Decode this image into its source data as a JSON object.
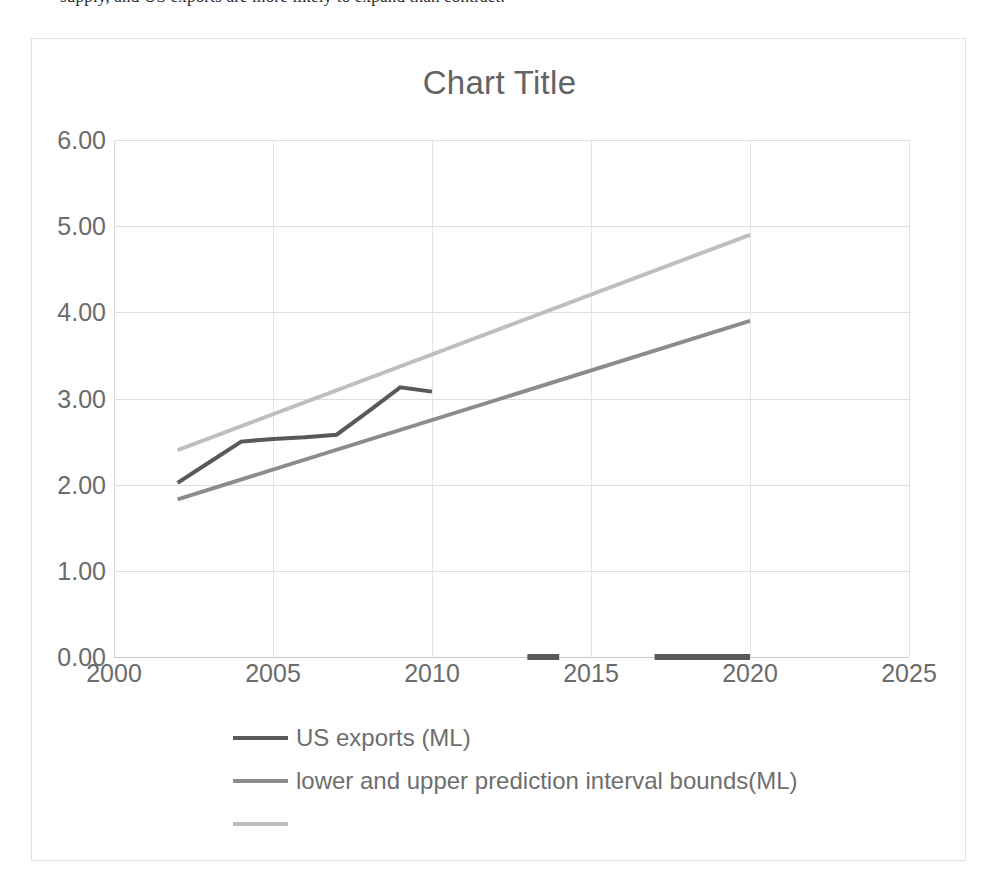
{
  "page": {
    "cropped_text_above": "supply, and US exports are more likely to expand than contract."
  },
  "chart_data": {
    "type": "line",
    "title": "Chart Title",
    "xlabel": "",
    "ylabel": "",
    "xlim": [
      2000,
      2025
    ],
    "ylim": [
      0.0,
      6.0
    ],
    "xticks": [
      "2000",
      "2005",
      "2010",
      "2015",
      "2020",
      "2025"
    ],
    "xtick_values": [
      2000,
      2005,
      2010,
      2015,
      2020,
      2025
    ],
    "yticks": [
      "0.00",
      "1.00",
      "2.00",
      "3.00",
      "4.00",
      "5.00",
      "6.00"
    ],
    "ytick_values": [
      0.0,
      1.0,
      2.0,
      3.0,
      4.0,
      5.0,
      6.0
    ],
    "grid": true,
    "legend_position": "bottom",
    "series": [
      {
        "name": "US exports (ML)",
        "color": "#595959",
        "x": [
          2002,
          2003,
          2004,
          2005,
          2006,
          2007,
          2008,
          2009,
          2010
        ],
        "values": [
          2.02,
          2.26,
          2.5,
          2.53,
          2.55,
          2.58,
          2.85,
          3.13,
          3.08
        ]
      },
      {
        "name": "lower and upper prediction interval bounds(ML)",
        "color": "#8c8c8c",
        "x": [
          2002,
          2020
        ],
        "values": [
          1.83,
          3.9
        ]
      },
      {
        "name": "",
        "color": "#bfbfbf",
        "x": [
          2002,
          2020
        ],
        "values": [
          2.4,
          4.9
        ]
      },
      {
        "name": "zero-axis markers",
        "color": "#595959",
        "segments": [
          {
            "x": [
              2013,
              2014
            ],
            "values": [
              0.0,
              0.0
            ]
          },
          {
            "x": [
              2017,
              2020
            ],
            "values": [
              0.0,
              0.0
            ]
          }
        ]
      }
    ],
    "legend_entries": [
      {
        "label": "US exports (ML)",
        "color": "#595959"
      },
      {
        "label": "lower and upper prediction interval bounds(ML)",
        "color": "#8c8c8c"
      },
      {
        "label": "",
        "color": "#bfbfbf"
      }
    ]
  }
}
